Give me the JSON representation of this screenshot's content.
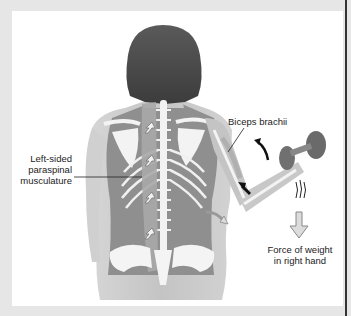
{
  "figure": {
    "labels": {
      "biceps": "Biceps brachii",
      "paraspinal_line1": "Left-sided",
      "paraspinal_line2": "paraspinal",
      "paraspinal_line3": "musculature",
      "force_line1": "Force of weight",
      "force_line2": "in right hand"
    },
    "colors": {
      "frame": "#e6e6e6",
      "panel": "#ffffff",
      "skin": "#c9c9c9",
      "muscle": "#8f8f8f",
      "bone": "#f4f4f4",
      "hair": "#4a4a4a",
      "dumbbell": "#6e6e6e",
      "arrow_black": "#111111",
      "arrow_outline": "#9a9a9a"
    }
  }
}
